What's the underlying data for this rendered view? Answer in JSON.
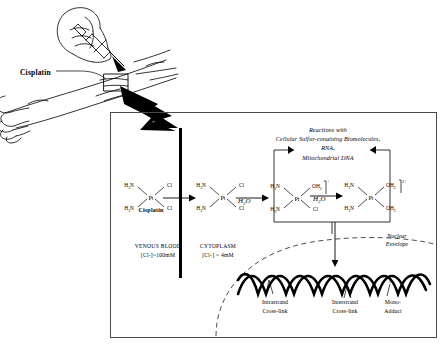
{
  "figure": {
    "domain": "biomedical-diagram"
  },
  "illustration": {
    "name": "syringe-injecting-arm",
    "callout_label": "Cisplatin",
    "description": "line drawing of a hand holding a syringe injecting into a forearm vein"
  },
  "panel": {
    "membrane": {
      "name": "plasma-membrane-bar"
    },
    "compartments": [
      {
        "id": "venous-blood",
        "name": "VENOUS BLOOD",
        "concentration": "[Cl-]~100mM"
      },
      {
        "id": "cytoplasm",
        "name": "CYTOPLASM",
        "concentration": "[Cl-] ~ 4mM"
      }
    ],
    "reaction_note": {
      "line1": "Reactions with",
      "line2": "Cellular Sulfur-conaining Biomolecules,",
      "line3": "RNA,",
      "line4": "Mitochondrial DNA"
    },
    "nuclear_envelope": {
      "line1": "Nuclear",
      "line2": "Envelope"
    },
    "structures": [
      {
        "id": "cisplatin",
        "caption": "Cisplatin",
        "center": "Pt",
        "charge": "",
        "ligand_top_left": "H3N",
        "ligand_bottom_left": "H3N",
        "ligand_top_right": "Cl",
        "ligand_bottom_right": "Cl"
      },
      {
        "id": "cisplatin-cytoplasm",
        "caption": "",
        "center": "Pt",
        "charge": "",
        "ligand_top_left": "H3N",
        "ligand_bottom_left": "H3N",
        "ligand_top_right": "Cl",
        "ligand_bottom_right": "Cl"
      },
      {
        "id": "monoaqua",
        "caption": "",
        "center": "Pt",
        "charge": "+",
        "ligand_top_left": "H3N",
        "ligand_bottom_left": "H3N",
        "ligand_top_right": "OH2",
        "ligand_bottom_right": "Cl"
      },
      {
        "id": "diaqua",
        "caption": "",
        "center": "Pt",
        "charge": "2+",
        "ligand_top_left": "H3N",
        "ligand_bottom_left": "H3N",
        "ligand_top_right": "OH2",
        "ligand_bottom_right": "OH2"
      }
    ],
    "reagents": [
      {
        "id": "h2o-1",
        "label": "H2O"
      },
      {
        "id": "h2o-2",
        "label": "H2O"
      }
    ],
    "dna_adducts": [
      {
        "id": "intrastrand",
        "line1": "Intrastrand",
        "line2": "Cross-link"
      },
      {
        "id": "interstrand",
        "line1": "Interstrand",
        "line2": "Cross-link"
      },
      {
        "id": "monoadduct",
        "line1": "Mono-",
        "line2": "Adduct"
      }
    ]
  },
  "colors": {
    "ink": "#000000",
    "frame": "#4a4a4a",
    "background": "#ffffff"
  }
}
